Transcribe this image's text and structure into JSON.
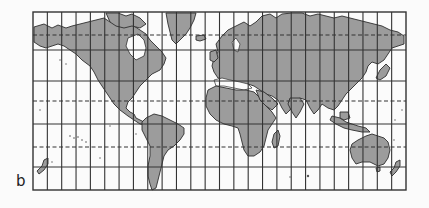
{
  "figure": {
    "panel_label": "b",
    "projection": "Mercator",
    "frame": {
      "x": 33,
      "y": 12,
      "width": 373,
      "height": 178
    },
    "meridian_count": 26,
    "parallels": [
      {
        "y": 35,
        "style": "dashed",
        "name": "Arctic Circle"
      },
      {
        "y": 50,
        "style": "solid"
      },
      {
        "y": 81,
        "style": "solid"
      },
      {
        "y": 101,
        "style": "dashed",
        "name": "Tropic of Cancer"
      },
      {
        "y": 124,
        "style": "solid",
        "name": "Equator"
      },
      {
        "y": 147,
        "style": "dashed",
        "name": "Tropic of Capricorn"
      },
      {
        "y": 167,
        "style": "solid"
      }
    ],
    "colors": {
      "land": "#9c9c9c",
      "lines": "#333333",
      "ocean": "#fbfbfb"
    },
    "continents": [
      "North America",
      "Greenland",
      "South America",
      "Europe",
      "Africa",
      "Asia",
      "Australia",
      "New Zealand"
    ]
  }
}
